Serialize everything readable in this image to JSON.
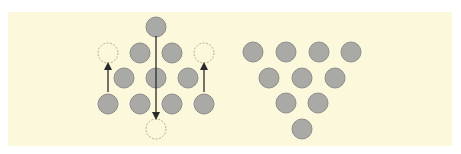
{
  "figure": {
    "colors": {
      "background": "#fcf8dc",
      "coin_fill": "#a9a9a6",
      "coin_stroke": "#8e8e8a",
      "ghost_stroke": "#b0a998",
      "arrow": "#2a2a2a"
    },
    "left_diagram": {
      "coins": [
        {
          "x": 156,
          "y": 27
        },
        {
          "x": 140,
          "y": 53
        },
        {
          "x": 172,
          "y": 53
        },
        {
          "x": 124,
          "y": 78
        },
        {
          "x": 156,
          "y": 78
        },
        {
          "x": 188,
          "y": 78
        },
        {
          "x": 108,
          "y": 104
        },
        {
          "x": 140,
          "y": 104
        },
        {
          "x": 172,
          "y": 104
        },
        {
          "x": 204,
          "y": 104
        }
      ],
      "ghost_positions": [
        {
          "x": 108,
          "y": 53
        },
        {
          "x": 204,
          "y": 53
        },
        {
          "x": 156,
          "y": 129
        }
      ],
      "arrows": [
        {
          "from": [
            108,
            92
          ],
          "to": [
            108,
            66
          ]
        },
        {
          "from": [
            204,
            92
          ],
          "to": [
            204,
            66
          ]
        },
        {
          "from": [
            156,
            36
          ],
          "to": [
            156,
            116
          ]
        }
      ]
    },
    "right_diagram": {
      "coins": [
        {
          "x": 253,
          "y": 52
        },
        {
          "x": 286,
          "y": 52
        },
        {
          "x": 319,
          "y": 52
        },
        {
          "x": 351,
          "y": 52
        },
        {
          "x": 269,
          "y": 78
        },
        {
          "x": 302,
          "y": 78
        },
        {
          "x": 335,
          "y": 78
        },
        {
          "x": 286,
          "y": 103
        },
        {
          "x": 318,
          "y": 103
        },
        {
          "x": 302,
          "y": 129
        }
      ]
    },
    "coin_radius": 10
  }
}
